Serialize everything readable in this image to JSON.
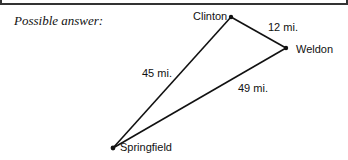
{
  "caption": "Possible answer:",
  "points": {
    "clinton": {
      "label": "Clinton",
      "x": 231,
      "y": 17
    },
    "weldon": {
      "label": "Weldon",
      "x": 286,
      "y": 48
    },
    "springfield": {
      "label": "Springfield",
      "x": 113,
      "y": 148
    }
  },
  "distances": {
    "clinton_weldon": "12 mi.",
    "clinton_springfield": "45 mi.",
    "weldon_springfield": "49 mi."
  }
}
